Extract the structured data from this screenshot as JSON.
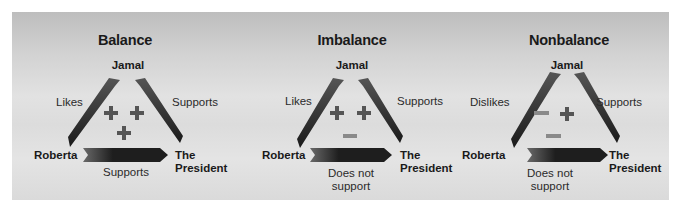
{
  "colors": {
    "arrow_dark": "#1e1e1e",
    "arrow_light": "#5a5a5a",
    "plus": "#555555",
    "minus": "#8a8a8a",
    "panel_top": "#bdbdbd",
    "panel_mid": "#e2e2e2"
  },
  "diagrams": [
    {
      "title": "Balance",
      "nodes": {
        "top": "Jamal",
        "left": "Roberta",
        "right_line1": "The",
        "right_line2": "President"
      },
      "relations": {
        "left": "Likes",
        "right": "Supports",
        "bottom_line1": "Supports",
        "bottom_line2": ""
      },
      "signs": [
        "plus",
        "plus",
        "plus"
      ]
    },
    {
      "title": "Imbalance",
      "nodes": {
        "top": "Jamal",
        "left": "Roberta",
        "right_line1": "The",
        "right_line2": "President"
      },
      "relations": {
        "left": "Likes",
        "right": "Supports",
        "bottom_line1": "Does not",
        "bottom_line2": "support"
      },
      "signs": [
        "plus",
        "plus",
        "minus"
      ]
    },
    {
      "title": "Nonbalance",
      "nodes": {
        "top": "Jamal",
        "left": "Roberta",
        "right_line1": "The",
        "right_line2": "President"
      },
      "relations": {
        "left": "Dislikes",
        "right": "Supports",
        "bottom_line1": "Does not",
        "bottom_line2": "support"
      },
      "signs": [
        "minus",
        "plus",
        "minus"
      ]
    }
  ]
}
